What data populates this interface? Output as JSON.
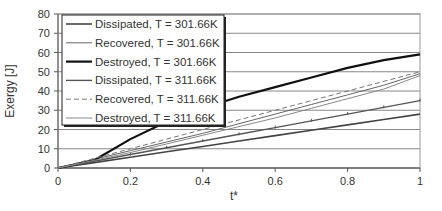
{
  "chart_data": {
    "type": "line",
    "title": "",
    "xlabel": "t*",
    "ylabel": "Exergy [J]",
    "xlim": [
      0,
      1
    ],
    "ylim": [
      0,
      80
    ],
    "x_ticks": [
      "0",
      "0.2",
      "0.4",
      "0.6",
      "0.8",
      "1"
    ],
    "y_ticks": [
      "0",
      "10",
      "20",
      "30",
      "40",
      "50",
      "60",
      "70",
      "80"
    ],
    "grid": {
      "horizontal": true,
      "vertical": false
    },
    "legend_position": "upper-left (inside)",
    "x": [
      0,
      0.1,
      0.2,
      0.3,
      0.4,
      0.5,
      0.6,
      0.7,
      0.8,
      0.9,
      1.0
    ],
    "series": [
      {
        "name": "Dissipated, T = 301.66K",
        "style": "solid-medium",
        "color": "#444444",
        "values": [
          0,
          2.8,
          5.6,
          8.4,
          11.2,
          14,
          16.8,
          19.6,
          22.4,
          25.2,
          28
        ]
      },
      {
        "name": "Recovered, T = 301.66K",
        "style": "solid-thin",
        "color": "#666666",
        "values": [
          0,
          4.5,
          9,
          13.5,
          18,
          23,
          28,
          33,
          38,
          43,
          49
        ]
      },
      {
        "name": "Destroyed, T = 301.66K",
        "style": "solid-thick",
        "color": "#111111",
        "values": [
          0,
          4,
          15,
          24,
          31,
          37,
          42,
          47,
          52,
          56,
          59
        ]
      },
      {
        "name": "Dissipated, T = 311.66K",
        "style": "solid-markers",
        "color": "#555555",
        "values": [
          0,
          3.5,
          7,
          10.5,
          14,
          17.5,
          21,
          24.5,
          28,
          31.5,
          35
        ]
      },
      {
        "name": "Recovered, T = 311.66K",
        "style": "dashed",
        "color": "#777777",
        "values": [
          0,
          5,
          10,
          15,
          20,
          25,
          30,
          35,
          40,
          45,
          50
        ]
      },
      {
        "name": "Destroyed, T = 311.66K",
        "style": "solid-thin",
        "color": "#888888",
        "values": [
          0,
          4,
          8,
          12.5,
          17,
          21.5,
          26,
          31,
          36,
          41,
          48
        ]
      }
    ]
  },
  "labels": {
    "xlabel": "t*",
    "ylabel": "Exergy [J]",
    "legend": [
      "Dissipated, T = 301.66K",
      "Recovered, T = 301.66K",
      "Destroyed, T = 301.66K",
      "Dissipated, T = 311.66K",
      "Recovered, T = 311.66K",
      "Destroyed, T = 311.66K"
    ]
  }
}
